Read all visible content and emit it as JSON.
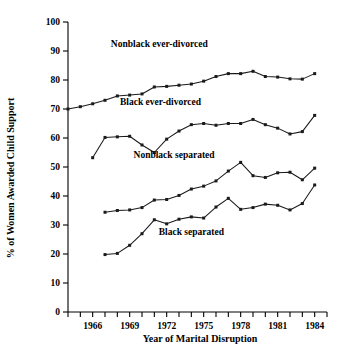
{
  "chart_data": {
    "type": "line",
    "title": "",
    "xlabel": "Year of Marital Disruption",
    "ylabel": "% of Women Awarded Child Support",
    "xlim": [
      1964,
      1985
    ],
    "ylim": [
      0,
      100
    ],
    "grid": false,
    "legend_position": "inline-annotations",
    "ytick_labels": [
      "0",
      "10",
      "20",
      "30",
      "40",
      "50",
      "60",
      "70",
      "80",
      "90",
      "100"
    ],
    "ytick_values": [
      0,
      10,
      20,
      30,
      40,
      50,
      60,
      70,
      80,
      90,
      100
    ],
    "xtick_values": [
      1964,
      1965,
      1966,
      1967,
      1968,
      1969,
      1970,
      1971,
      1972,
      1973,
      1974,
      1975,
      1976,
      1977,
      1978,
      1979,
      1980,
      1981,
      1982,
      1983,
      1984,
      1985
    ],
    "xtick_labels_shown": [
      "1966",
      "1969",
      "1972",
      "1975",
      "1978",
      "1981",
      "1984"
    ],
    "xtick_labeled_values": [
      1966,
      1969,
      1972,
      1975,
      1978,
      1981,
      1984
    ],
    "series": [
      {
        "name": "Nonblack ever-divorced",
        "label": "Nonblack ever-divorced",
        "x": [
          1964,
          1965,
          1966,
          1967,
          1968,
          1969,
          1970,
          1971,
          1972,
          1973,
          1974,
          1975,
          1976,
          1977,
          1978,
          1979,
          1980,
          1981,
          1982,
          1983,
          1984
        ],
        "values": [
          70.0,
          70.8,
          71.8,
          73.0,
          74.5,
          74.8,
          75.2,
          77.6,
          77.8,
          78.2,
          78.6,
          79.6,
          81.2,
          82.2,
          82.2,
          83.0,
          81.2,
          81.0,
          80.4,
          80.3,
          82.2
        ],
        "label_x": 1971.4,
        "label_y": 91.5
      },
      {
        "name": "Black ever-divorced",
        "label": "Black ever-divorced",
        "x": [
          1966,
          1967,
          1968,
          1969,
          1970,
          1971,
          1972,
          1973,
          1974,
          1975,
          1976,
          1977,
          1978,
          1979,
          1980,
          1981,
          1982,
          1983,
          1984
        ],
        "values": [
          53.2,
          60.2,
          60.4,
          60.6,
          57.6,
          55.0,
          59.6,
          62.4,
          64.6,
          65.0,
          64.4,
          65.0,
          65.0,
          66.4,
          64.6,
          63.4,
          61.4,
          62.2,
          67.8
        ],
        "label_x": 1971.5,
        "label_y": 71.5
      },
      {
        "name": "Nonblack separated",
        "label": "Nonblack separated",
        "x": [
          1967,
          1968,
          1969,
          1970,
          1971,
          1972,
          1973,
          1974,
          1975,
          1976,
          1977,
          1978,
          1979,
          1980,
          1981,
          1982,
          1983,
          1984
        ],
        "values": [
          34.4,
          35.0,
          35.2,
          36.0,
          38.6,
          38.8,
          40.2,
          42.4,
          43.4,
          45.2,
          48.6,
          51.6,
          47.0,
          46.4,
          48.0,
          48.2,
          45.6,
          49.6
        ],
        "label_x": 1972.6,
        "label_y": 53.0
      },
      {
        "name": "Black separated",
        "label": "Black separated",
        "x": [
          1967,
          1968,
          1969,
          1970,
          1971,
          1972,
          1973,
          1974,
          1975,
          1976,
          1977,
          1978,
          1979,
          1980,
          1981,
          1982,
          1983,
          1984
        ],
        "values": [
          19.8,
          20.2,
          23.0,
          27.0,
          31.8,
          30.4,
          32.0,
          32.8,
          32.4,
          36.2,
          39.2,
          35.4,
          36.0,
          37.2,
          36.8,
          35.2,
          37.4,
          43.8
        ],
        "label_x": 1974.0,
        "label_y": 26.5
      }
    ]
  }
}
